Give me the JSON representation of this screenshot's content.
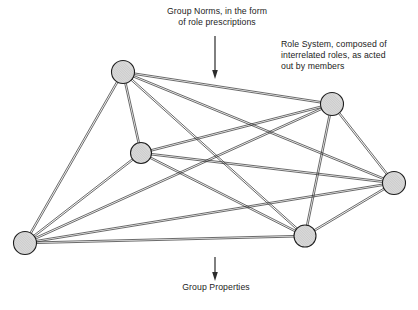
{
  "diagram": {
    "background_color": "#ffffff",
    "line_color": "#2b2b2b",
    "node_fill_color": "#d9d9d9",
    "node_stroke_color": "#1e1e1e",
    "text_color": "#1c1c1c",
    "annotations": {
      "group_norms": "Group Norms, in the form\nof role prescriptions",
      "role_system": "Role System, composed of\ninterrelated roles, as acted\nout by members",
      "group_properties": "Group Properties"
    },
    "arrows": [
      {
        "name": "arrow-to-network",
        "direction": "down",
        "x": 215,
        "y_start": 36,
        "y_end": 79,
        "points_to": "network"
      },
      {
        "name": "arrow-to-group-properties",
        "direction": "down",
        "x": 215,
        "y_start": 257,
        "y_end": 281,
        "points_to": "Group Properties"
      }
    ],
    "nodes": [
      {
        "id": "n1",
        "label": "member-node-top-left",
        "x": 123,
        "y": 72,
        "r": 11.5
      },
      {
        "id": "n2",
        "label": "member-node-mid-left",
        "x": 141,
        "y": 153,
        "r": 10.5
      },
      {
        "id": "n3",
        "label": "member-node-bottom-left",
        "x": 25,
        "y": 243,
        "r": 11.5
      },
      {
        "id": "n4",
        "label": "member-node-top-right",
        "x": 332,
        "y": 104,
        "r": 11.5
      },
      {
        "id": "n5",
        "label": "member-node-far-right",
        "x": 394,
        "y": 183,
        "r": 11.5
      },
      {
        "id": "n6",
        "label": "member-node-bottom-right",
        "x": 305,
        "y": 236,
        "r": 11.0
      }
    ],
    "edges": [
      {
        "from": "n1",
        "to": "n2"
      },
      {
        "from": "n1",
        "to": "n3"
      },
      {
        "from": "n1",
        "to": "n4"
      },
      {
        "from": "n1",
        "to": "n5"
      },
      {
        "from": "n1",
        "to": "n6"
      },
      {
        "from": "n2",
        "to": "n3"
      },
      {
        "from": "n2",
        "to": "n4"
      },
      {
        "from": "n2",
        "to": "n5"
      },
      {
        "from": "n2",
        "to": "n6"
      },
      {
        "from": "n3",
        "to": "n4"
      },
      {
        "from": "n3",
        "to": "n5"
      },
      {
        "from": "n3",
        "to": "n6"
      },
      {
        "from": "n4",
        "to": "n5"
      },
      {
        "from": "n4",
        "to": "n6"
      },
      {
        "from": "n5",
        "to": "n6"
      }
    ],
    "edge_style": {
      "type": "double-line",
      "gap": 1.6,
      "stroke_width": 0.7
    }
  }
}
